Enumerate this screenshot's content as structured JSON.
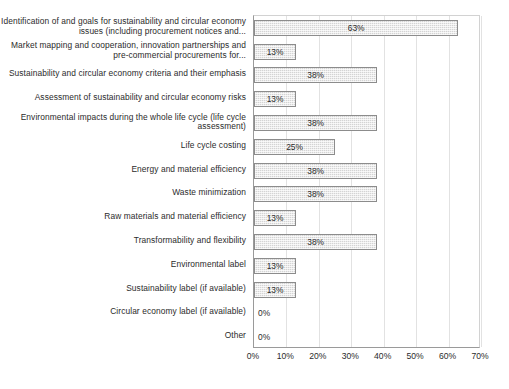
{
  "chart_data": {
    "type": "bar",
    "orientation": "horizontal",
    "title": "",
    "subtitle": "",
    "xlabel": "",
    "ylabel": "",
    "xlim": [
      0,
      70
    ],
    "grid": true,
    "legend": false,
    "value_format": "percent",
    "categories": [
      "Identification of and goals for sustainability and circular economy issues (including procurement notices and...",
      "Market mapping and cooperation, innovation partnerships and pre-commercial procurements for...",
      "Sustainability and circular economy criteria and their emphasis",
      "Assessment of sustainability and circular economy risks",
      "Environmental impacts during the whole life cycle (life cycle assessment)",
      "Life cycle costing",
      "Energy and material efficiency",
      "Waste minimization",
      "Raw materials and material efficiency",
      "Transformability and flexibility",
      "Environmental label",
      "Sustainability label (if available)",
      "Circular economy label (if available)",
      "Other"
    ],
    "values": [
      63,
      13,
      38,
      13,
      38,
      25,
      38,
      38,
      13,
      38,
      13,
      13,
      0,
      0
    ],
    "data_labels": [
      "63%",
      "13%",
      "38%",
      "13%",
      "38%",
      "25%",
      "38%",
      "38%",
      "13%",
      "38%",
      "13%",
      "13%",
      "0%",
      "0%"
    ],
    "ticks": [
      0,
      10,
      20,
      30,
      40,
      50,
      60,
      70
    ],
    "tick_labels": [
      "0%",
      "10%",
      "20%",
      "30%",
      "40%",
      "50%",
      "60%",
      "70%"
    ],
    "colors": {
      "bar_fill": "#d4d4d4",
      "bar_border": "#8c8c8c",
      "gridline": "#e2e2e2",
      "axis_line": "#9a9a9a",
      "text": "#2b2b2b",
      "background": "#ffffff"
    }
  }
}
